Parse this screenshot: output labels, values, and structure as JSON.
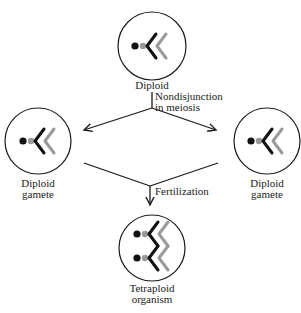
{
  "nodes": {
    "top": {
      "label_line1": "Diploid",
      "label_line2": ""
    },
    "left": {
      "label_line1": "Diploid",
      "label_line2": "gamete"
    },
    "right": {
      "label_line1": "Diploid",
      "label_line2": "gamete"
    },
    "bottom": {
      "label_line1": "Tetraploid",
      "label_line2": "organism"
    }
  },
  "edges": {
    "split": {
      "label_line1": "Nondisjunction",
      "label_line2": "in meiosis"
    },
    "merge": {
      "label_line1": "Fertilization"
    }
  },
  "colors": {
    "line": "#1a1a1a",
    "dark_chromosome": "#111111",
    "light_chromosome": "#9a9a9a"
  }
}
